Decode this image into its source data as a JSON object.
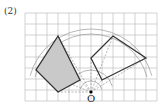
{
  "problem_label": "(2)",
  "origin_label": "O",
  "grid": {
    "x0": 25,
    "y0": 13,
    "cell": 11,
    "cols": 12,
    "rows": 8,
    "color": "#b5b5b5"
  },
  "origin": [
    91,
    92
  ],
  "shaded_figure": {
    "points": [
      [
        58,
        36
      ],
      [
        36,
        70
      ],
      [
        58,
        92
      ],
      [
        80,
        80
      ]
    ],
    "fill": "#c9c9c9"
  },
  "rotated_figure": {
    "points": [
      [
        91,
        58
      ],
      [
        113,
        36
      ],
      [
        146,
        58
      ],
      [
        102,
        80
      ]
    ]
  },
  "arc_radii": [
    11,
    22,
    58,
    63
  ],
  "colors": {
    "stroke": "#333333",
    "dashed": "#888888"
  }
}
